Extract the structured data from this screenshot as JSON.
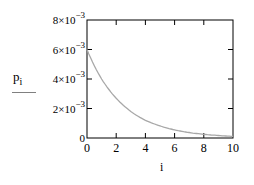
{
  "chart_data": {
    "type": "line",
    "title": "",
    "xlabel": "i",
    "ylabel": "",
    "legend": [
      {
        "name": "p_i",
        "label_text": "p",
        "label_subscript": "i",
        "color": "#a0a0a0"
      }
    ],
    "legend_position": "left",
    "grid": false,
    "xlim": [
      0,
      10
    ],
    "ylim": [
      0,
      0.008
    ],
    "x_ticks": [
      "0",
      "2",
      "4",
      "6",
      "8",
      "10"
    ],
    "y_ticks": [
      {
        "value": 0,
        "label": "0"
      },
      {
        "value": 0.002,
        "label": "2×10",
        "exp": "-3"
      },
      {
        "value": 0.004,
        "label": "4×10",
        "exp": "-3"
      },
      {
        "value": 0.006,
        "label": "6×10",
        "exp": "-3"
      },
      {
        "value": 0.008,
        "label": "8×10",
        "exp": "-3"
      }
    ],
    "x": [
      0,
      1,
      2,
      3,
      4,
      5,
      6,
      7,
      8,
      9,
      10
    ],
    "series": [
      {
        "name": "p_i",
        "values": [
          0.006,
          0.004,
          0.0027,
          0.0018,
          0.0012,
          0.00082,
          0.00055,
          0.00037,
          0.00025,
          0.00017,
          0.00011
        ]
      }
    ]
  }
}
